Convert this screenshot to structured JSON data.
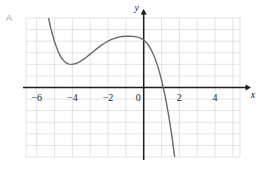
{
  "figure": {
    "panel_label": "A",
    "background_color": "#ffffff",
    "grid_color": "#d7dde4",
    "axis_color": "#1d1d1d",
    "curve_color": "#6b6b6b"
  },
  "chart_data": {
    "type": "line",
    "title": "",
    "subtitle": "",
    "xlabel": "x",
    "ylabel": "y",
    "xlim": [
      -6.6,
      5.4
    ],
    "ylim": [
      -6.0,
      6.0
    ],
    "grid": true,
    "legend": null,
    "x_ticks": [
      -6,
      -4,
      -2,
      0,
      2,
      4
    ],
    "x_tick_labels": [
      "-6",
      "-4",
      "-2",
      "0",
      "2",
      "4"
    ],
    "y_ticks": [],
    "y_tick_labels": [],
    "x_gridline_values": [
      -6,
      -5,
      -4,
      -3,
      -2,
      -1,
      0,
      1,
      2,
      3,
      4,
      5
    ],
    "y_gridline_values": [
      -5,
      -4,
      -3,
      -2,
      -1,
      0,
      1,
      2,
      3,
      4,
      5
    ],
    "annotations": [],
    "series": [
      {
        "name": "cubic curve",
        "color": "#6b6b6b",
        "features": {
          "local_minimum": [
            -4.0,
            2.0
          ],
          "local_maximum": [
            -0.6,
            4.4
          ],
          "x_intercept": 1.2,
          "y_intercept": 4.1
        },
        "x": [
          -5.55,
          -5.4,
          -5.2,
          -5.0,
          -4.8,
          -4.6,
          -4.4,
          -4.2,
          -4.0,
          -3.8,
          -3.6,
          -3.4,
          -3.2,
          -3.0,
          -2.8,
          -2.6,
          -2.4,
          -2.2,
          -2.0,
          -1.8,
          -1.6,
          -1.4,
          -1.2,
          -1.0,
          -0.8,
          -0.6,
          -0.4,
          -0.2,
          0.0,
          0.2,
          0.4,
          0.6,
          0.8,
          1.0,
          1.2,
          1.4,
          1.6,
          1.8,
          1.95
        ],
        "y": [
          7.95,
          6.45,
          5.05,
          3.95,
          3.1,
          2.52,
          2.17,
          2.02,
          2.0,
          2.07,
          2.21,
          2.41,
          2.63,
          2.88,
          3.13,
          3.38,
          3.61,
          3.82,
          4.0,
          4.15,
          4.27,
          4.35,
          4.4,
          4.42,
          4.42,
          4.41,
          4.37,
          4.28,
          4.1,
          3.8,
          3.32,
          2.66,
          1.78,
          0.66,
          -0.72,
          -2.4,
          -4.4,
          -6.75,
          -8.3
        ]
      }
    ]
  }
}
